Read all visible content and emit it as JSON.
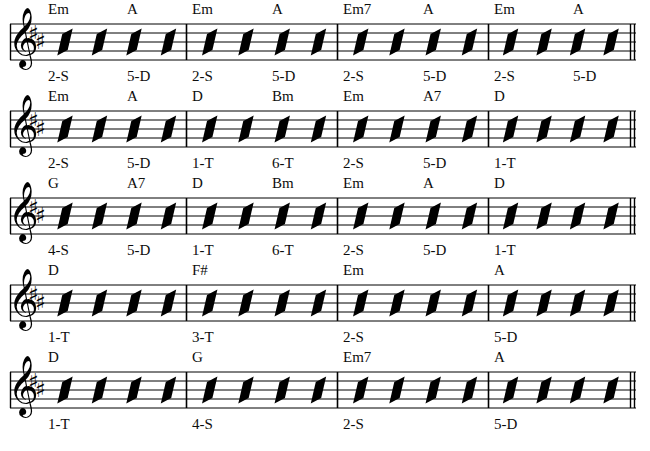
{
  "document": {
    "type": "guitar-chord-rhythm-chart",
    "key_signature": "2 sharps (D major / B minor)",
    "clef": "treble",
    "slashes_per_measure": 4,
    "ink_color": "#000000",
    "paper_color": "#ffffff"
  },
  "notation": {
    "clef_glyph": "treble-clef",
    "sharp_glyph": "♯",
    "slash_glyph": "rhythm-slash",
    "barline": "single-barline",
    "final_barline": "double-barline"
  },
  "layout": {
    "staff_left": 10,
    "staff_right": 636,
    "system_tops": [
      20,
      107,
      194,
      281,
      368
    ],
    "barline_x": [
      186,
      337,
      488
    ],
    "measure_starts": [
      48,
      192,
      343,
      494
    ],
    "chord_slot_x": [
      48,
      127,
      192,
      272,
      343,
      423,
      494,
      573
    ],
    "measure_slot_x": [
      48,
      192,
      343,
      494
    ]
  },
  "systems": [
    {
      "index": 1,
      "chords": [
        "Em",
        "A",
        "Em",
        "A",
        "Em7",
        "A",
        "Em",
        "A"
      ],
      "chord_slots": [
        0,
        1,
        2,
        3,
        4,
        5,
        6,
        7
      ],
      "fingerings": [
        "2-S",
        "5-D",
        "2-S",
        "5-D",
        "2-S",
        "5-D",
        "2-S",
        "5-D"
      ],
      "fingering_slots": [
        0,
        1,
        2,
        3,
        4,
        5,
        6,
        7
      ]
    },
    {
      "index": 2,
      "chords": [
        "Em",
        "A",
        "D",
        "Bm",
        "Em",
        "A7",
        "D"
      ],
      "chord_slots": [
        0,
        1,
        2,
        3,
        4,
        5,
        6
      ],
      "fingerings": [
        "2-S",
        "5-D",
        "1-T",
        "6-T",
        "2-S",
        "5-D",
        "1-T"
      ],
      "fingering_slots": [
        0,
        1,
        2,
        3,
        4,
        5,
        6
      ]
    },
    {
      "index": 3,
      "chords": [
        "G",
        "A7",
        "D",
        "Bm",
        "Em",
        "A",
        "D"
      ],
      "chord_slots": [
        0,
        1,
        2,
        3,
        4,
        5,
        6
      ],
      "fingerings": [
        "4-S",
        "5-D",
        "1-T",
        "6-T",
        "2-S",
        "5-D",
        "1-T"
      ],
      "fingering_slots": [
        0,
        1,
        2,
        3,
        4,
        5,
        6
      ]
    },
    {
      "index": 4,
      "chords": [
        "D",
        "F#",
        "Em",
        "A"
      ],
      "chord_slots": [
        0,
        2,
        4,
        6
      ],
      "fingerings": [
        "1-T",
        "3-T",
        "2-S",
        "5-D"
      ],
      "fingering_slots": [
        0,
        2,
        4,
        6
      ]
    },
    {
      "index": 5,
      "chords": [
        "D",
        "G",
        "Em7",
        "A"
      ],
      "chord_slots": [
        0,
        2,
        4,
        6
      ],
      "fingerings": [
        "1-T",
        "4-S",
        "2-S",
        "5-D"
      ],
      "fingering_slots": [
        0,
        2,
        4,
        6
      ]
    }
  ]
}
